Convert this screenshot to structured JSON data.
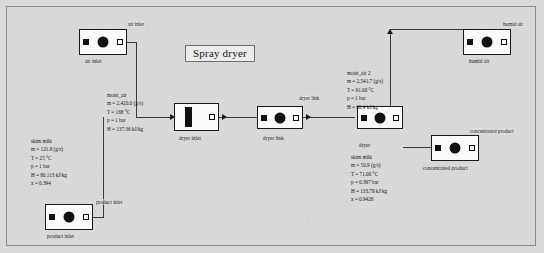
{
  "diagram": {
    "title": "Spray dryer",
    "blocks": [
      {
        "id": "air-inlet",
        "label": "air inlet",
        "port_label": "air inlet"
      },
      {
        "id": "product-inlet",
        "label": "product inlet",
        "port_label": "product inlet"
      },
      {
        "id": "dryer-inlet",
        "label": "dryer inlet",
        "port_label": ""
      },
      {
        "id": "dryer-link",
        "label": "dryer link",
        "port_label": "dryer link"
      },
      {
        "id": "dryer",
        "label": "dryer",
        "port_label": ""
      },
      {
        "id": "humid-air",
        "label": "humid air",
        "port_label": "humid air"
      },
      {
        "id": "concentrated-product",
        "label": "concentrated product",
        "port_label": "concentrated product"
      }
    ],
    "streams": [
      {
        "id": "moist-air",
        "name": "moist_air",
        "lines": [
          "m = 2,420.0 (g/s)",
          "T = 168 °C",
          "p = 1 bar",
          "H = 137.36 kJ/kg"
        ]
      },
      {
        "id": "skim-milk-feed",
        "name": "skim milk",
        "lines": [
          "m = 121.8 (g/s)",
          "T = 25 °C",
          "p = 1 bar",
          "H = 80.113 kJ/kg",
          "x = 0.394"
        ]
      },
      {
        "id": "moist-air-2",
        "name": "moist_air 2",
        "lines": [
          "m = 2,541.7 (g/s)",
          "T = 91.00 °C",
          "p = 1 bar",
          "H = 60.4 kJ/kg"
        ]
      },
      {
        "id": "dryer-outlet",
        "name": "dryer",
        "lines": [
          "skim milk",
          "m = 50.9 (g/s)",
          "T = 71.00 °C",
          "p = 0.397 bar",
          "H = 133.78 kJ/kg",
          "x = 0.9428"
        ]
      }
    ]
  }
}
